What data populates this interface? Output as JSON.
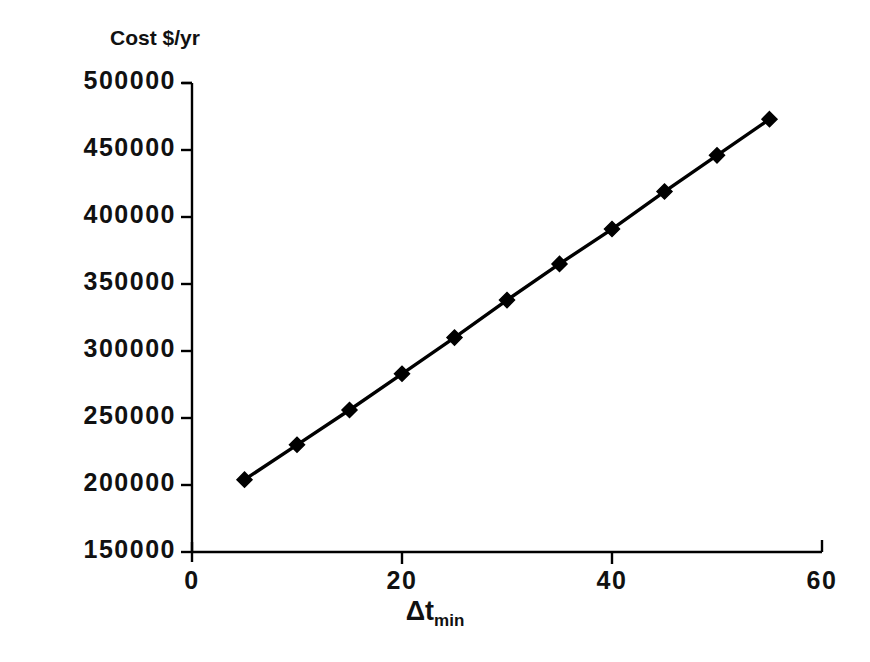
{
  "chart_data": {
    "type": "line",
    "title": "Cost $/yr",
    "xlabel": "Δt",
    "xlabel_subscript": "min",
    "ylabel": "",
    "x": [
      5,
      10,
      15,
      20,
      25,
      30,
      35,
      40,
      45,
      50,
      55
    ],
    "values": [
      204000,
      230000,
      256000,
      283000,
      310000,
      338000,
      365000,
      391000,
      419000,
      446000,
      473000
    ],
    "series": [
      {
        "name": "Cost",
        "values": [
          204000,
          230000,
          256000,
          283000,
          310000,
          338000,
          365000,
          391000,
          419000,
          446000,
          473000
        ]
      }
    ],
    "xlim": [
      0,
      60
    ],
    "ylim": [
      150000,
      500000
    ],
    "xticks": [
      0,
      20,
      40,
      60
    ],
    "xtick_labels": [
      "0",
      "20",
      "40",
      "60"
    ],
    "yticks": [
      150000,
      200000,
      250000,
      300000,
      350000,
      400000,
      450000,
      500000
    ],
    "ytick_labels": [
      "150000",
      "200000",
      "250000",
      "300000",
      "350000",
      "400000",
      "450000",
      "500000"
    ],
    "grid": false,
    "legend": false,
    "marker": "diamond",
    "line_color": "#000000",
    "marker_color": "#000000",
    "axis_color": "#000000",
    "background": "#ffffff"
  }
}
